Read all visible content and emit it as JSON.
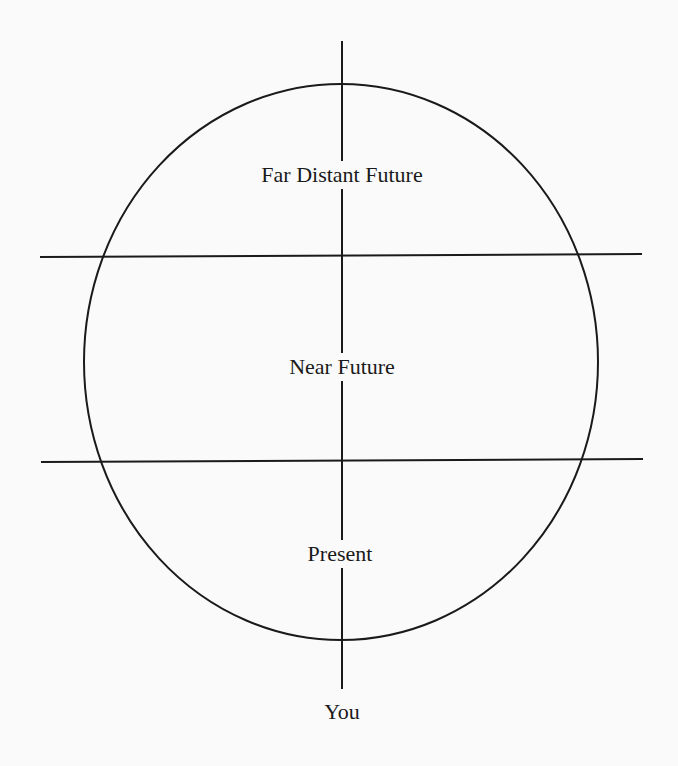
{
  "diagram": {
    "colors": {
      "line": "#1a1a1a",
      "background": "#fafafa"
    },
    "labels": {
      "far_future": "Far Distant Future",
      "near_future": "Near Future",
      "present": "Present",
      "you": "You"
    },
    "regions": [
      "Far Distant Future",
      "Near Future",
      "Present"
    ],
    "observer": "You"
  }
}
